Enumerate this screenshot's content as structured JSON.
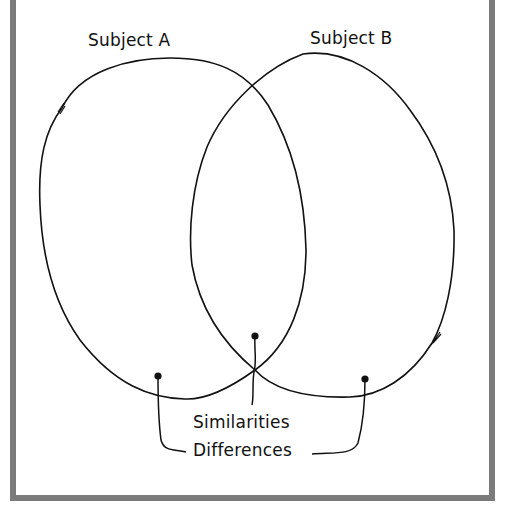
{
  "diagram": {
    "type": "venn",
    "sets": [
      {
        "label": "Subject A"
      },
      {
        "label": "Subject B"
      }
    ],
    "annotations": {
      "similarities": "Similarities",
      "differences": "Differences"
    },
    "colors": {
      "frame": "#7b7b7b",
      "stroke": "#111111",
      "background": "#ffffff"
    }
  }
}
